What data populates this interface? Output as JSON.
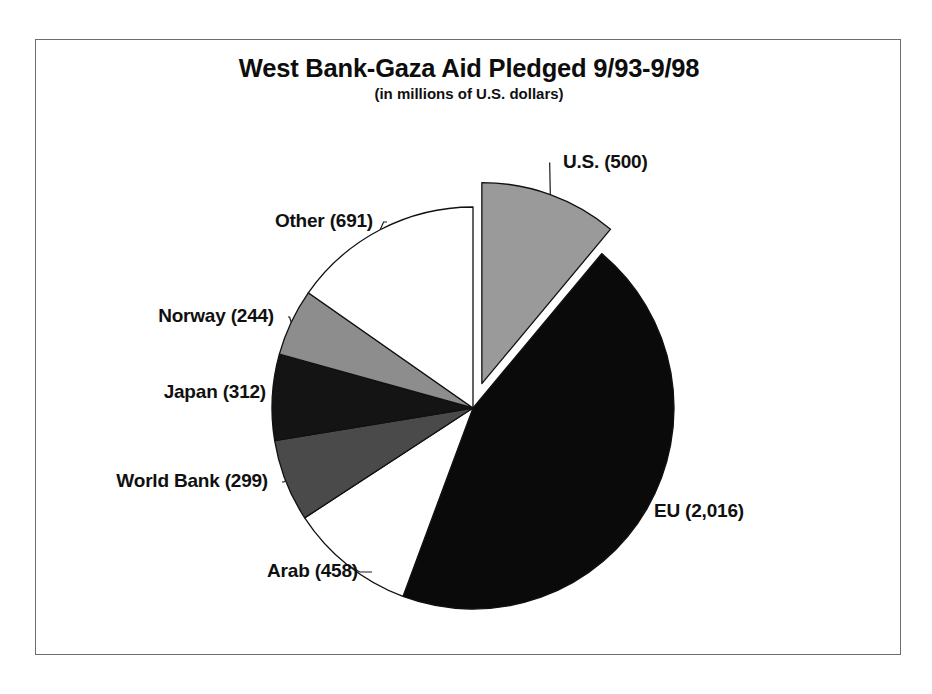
{
  "chart": {
    "title": "West Bank-Gaza Aid Pledged 9/93-9/98",
    "subtitle": "(in millions of U.S. dollars)"
  },
  "labels": {
    "us": "U.S. (500)",
    "eu": "EU (2,016)",
    "arab": "Arab (458)",
    "world_bank": "World Bank (299)",
    "japan": "Japan (312)",
    "norway": "Norway (244)",
    "other": "Other (691)"
  },
  "chart_data": {
    "type": "pie",
    "title": "West Bank-Gaza Aid Pledged 9/93-9/98",
    "subtitle": "(in millions of U.S. dollars)",
    "unit": "millions of U.S. dollars",
    "categories": [
      "U.S.",
      "EU",
      "Arab",
      "World Bank",
      "Japan",
      "Norway",
      "Other"
    ],
    "values": [
      500,
      2016,
      458,
      299,
      312,
      244,
      691
    ],
    "total": 4520,
    "data_labels": [
      "U.S. (500)",
      "EU (2,016)",
      "Arab (458)",
      "World Bank (299)",
      "Japan (312)",
      "Norway (244)",
      "Other (691)"
    ],
    "slice_colors": [
      "#9a9a9a",
      "#0a0a0a",
      "#ffffff",
      "#4a4a4a",
      "#141414",
      "#8d8d8d",
      "#ffffff"
    ],
    "exploded": [
      "U.S."
    ],
    "start_angle_deg": 0,
    "direction": "clockwise",
    "legend": "none",
    "grid": false,
    "leader_lines": true,
    "border": true
  },
  "geometry": {
    "center_x": 437,
    "center_y": 368,
    "radius": 201,
    "explode_offset": 26,
    "segments": [
      {
        "key": "us",
        "start": 0.0,
        "sweep": 39.82,
        "fill": "#9a9a9a",
        "explode": true
      },
      {
        "key": "eu",
        "start": 39.82,
        "sweep": 160.57,
        "fill": "#0a0a0a",
        "explode": false
      },
      {
        "key": "arab",
        "start": 200.39,
        "sweep": 36.48,
        "fill": "#ffffff",
        "explode": false
      },
      {
        "key": "world_bank",
        "start": 236.87,
        "sweep": 23.82,
        "fill": "#4a4a4a",
        "explode": false
      },
      {
        "key": "japan",
        "start": 260.69,
        "sweep": 24.85,
        "fill": "#141414",
        "explode": false
      },
      {
        "key": "norway",
        "start": 285.54,
        "sweep": 19.43,
        "fill": "#8d8d8d",
        "explode": false
      },
      {
        "key": "other",
        "start": 304.97,
        "sweep": 55.03,
        "fill": "#ffffff",
        "explode": false
      }
    ],
    "label_positions": {
      "us": {
        "x": 527,
        "y": 123,
        "align": "left",
        "lx1": 512,
        "ly1": 130,
        "lx2": 520,
        "ly2": 138,
        "lx3": 520,
        "ly3": 130
      },
      "eu": {
        "x": 618,
        "y": 472,
        "align": "left",
        "lx1": 600,
        "ly1": 479,
        "lx2": 608,
        "ly2": 487,
        "lx3": 612,
        "ly3": 479
      },
      "arab": {
        "x": 322,
        "y": 532,
        "align": "right",
        "lx1": 329,
        "ly1": 539,
        "lx2": 321,
        "ly2": 547,
        "lx3": 317,
        "ly3": 539
      },
      "world_bank": {
        "x": 232,
        "y": 442,
        "align": "right",
        "lx1": 239,
        "ly1": 449,
        "lx2": 231,
        "ly2": 456,
        "lx3": 227,
        "ly3": 449
      },
      "japan": {
        "x": 230,
        "y": 353,
        "align": "right",
        "lx1": 237,
        "ly1": 360,
        "lx2": 229,
        "ly2": 360,
        "lx3": 225,
        "ly3": 360
      },
      "norway": {
        "x": 238,
        "y": 277,
        "align": "right",
        "lx1": 245,
        "ly1": 284,
        "lx2": 237,
        "ly2": 278,
        "lx3": 233,
        "ly3": 284
      },
      "other": {
        "x": 337,
        "y": 182,
        "align": "right",
        "lx1": 344,
        "ly1": 189,
        "lx2": 336,
        "ly2": 183,
        "lx3": 332,
        "ly3": 189
      }
    }
  }
}
